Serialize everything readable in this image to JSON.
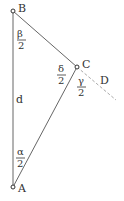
{
  "diagram": {
    "points": {
      "A": {
        "label": "A",
        "x": 13,
        "y": 187
      },
      "B": {
        "label": "B",
        "x": 13,
        "y": 11
      },
      "C": {
        "label": "C",
        "x": 77,
        "y": 67
      },
      "D": {
        "label": "D",
        "x": 116,
        "y": 100
      }
    },
    "segment_label": "d",
    "angles": {
      "beta": {
        "num": "β",
        "den": "2"
      },
      "delta": {
        "num": "δ",
        "den": "2"
      },
      "gamma": {
        "num": "γ",
        "den": "2"
      },
      "alpha": {
        "num": "α",
        "den": "2"
      }
    },
    "colors": {
      "line": "#555555",
      "dashed": "#999999",
      "text": "#333333"
    }
  }
}
